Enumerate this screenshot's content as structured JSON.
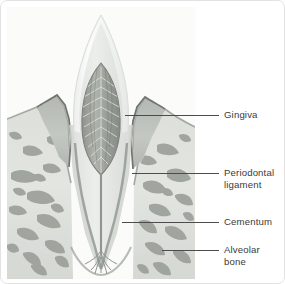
{
  "figure": {
    "type": "anatomical-diagram",
    "border_color": "#e2e2e2",
    "background_color": "#ffffff"
  },
  "illustration": {
    "name": "tooth-cross-section",
    "parts": [
      {
        "id": "enamel-crown",
        "label": "enamel crown",
        "color": "#f3f4f3"
      },
      {
        "id": "dentin",
        "label": "dentin",
        "color": "#e3e5e2"
      },
      {
        "id": "pulp-chamber",
        "label": "pulp chamber",
        "color": "#9fa39d"
      },
      {
        "id": "root-canal",
        "label": "root canal",
        "color": "#8f948d"
      },
      {
        "id": "gingiva",
        "label": "gingiva",
        "color": "#b9bdb7"
      },
      {
        "id": "gingiva-outline",
        "label": "gingiva outline",
        "color": "#7e837c"
      },
      {
        "id": "alveolar-bone",
        "label": "alveolar bone",
        "color": "#d7dad5"
      },
      {
        "id": "trabeculae",
        "label": "bone trabeculae",
        "color": "#9ba09a"
      },
      {
        "id": "periodontal-ligament",
        "label": "periodontal ligament",
        "color": "#cfd2cd"
      },
      {
        "id": "cementum",
        "label": "cementum",
        "color": "#9aa09a"
      }
    ]
  },
  "labels": [
    {
      "id": "gingiva",
      "text": "Gingiva",
      "leader": {
        "x": 196,
        "y": 114,
        "length": 22
      },
      "text_pos": {
        "x": 223,
        "y": 108
      }
    },
    {
      "id": "periodontal-ligament",
      "text": "Periodontal\nligament",
      "leader": {
        "x": 196,
        "y": 172,
        "length": 22
      },
      "text_pos": {
        "x": 223,
        "y": 166
      }
    },
    {
      "id": "cementum",
      "text": "Cementum",
      "leader": {
        "x": 196,
        "y": 221,
        "length": 22
      },
      "text_pos": {
        "x": 223,
        "y": 215
      }
    },
    {
      "id": "alveolar-bone",
      "text": "Alveolar\nbone",
      "leader": {
        "x": 196,
        "y": 249,
        "length": 22
      },
      "text_pos": {
        "x": 223,
        "y": 243
      }
    }
  ],
  "leader_segments": [
    {
      "id": "gingiva-inner",
      "x": 124,
      "y": 114,
      "length": 72
    },
    {
      "id": "periodontal-inner",
      "x": 131,
      "y": 172,
      "length": 65
    },
    {
      "id": "cementum-inner",
      "x": 121,
      "y": 221,
      "length": 75
    },
    {
      "id": "alveolar-inner",
      "x": 161,
      "y": 249,
      "length": 35
    }
  ],
  "colors": {
    "leader_line": "#4c4c4c",
    "label_text": "#3a3a3a"
  }
}
